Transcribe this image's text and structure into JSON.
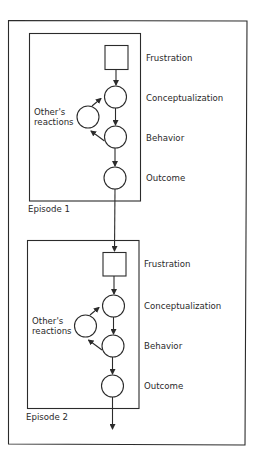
{
  "diagram": {
    "episodes": [
      {
        "label": "Episode 1",
        "nodes": {
          "frustration": "Frustration",
          "conceptualization": "Conceptualization",
          "behavior": "Behavior",
          "outcome": "Outcome"
        },
        "feedback": {
          "line1": "Other's",
          "line2": "reactions"
        }
      },
      {
        "label": "Episode 2",
        "nodes": {
          "frustration": "Frustration",
          "conceptualization": "Conceptualization",
          "behavior": "Behavior",
          "outcome": "Outcome"
        },
        "feedback": {
          "line1": "Other's",
          "line2": "reactions"
        }
      }
    ],
    "colors": {
      "stroke": "#2b2b2b",
      "background": "#ffffff"
    }
  }
}
